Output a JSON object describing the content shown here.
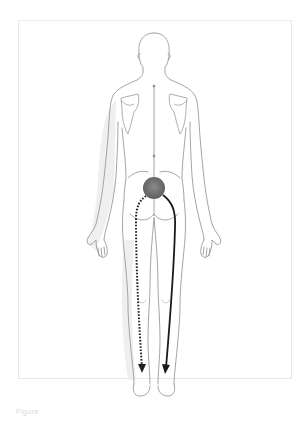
{
  "figure": {
    "pain_focus": {
      "label": "sacroiliac pain source",
      "color": "#6e6e6e"
    },
    "paths": [
      {
        "name": "dotted-referral-path",
        "style": "dotted",
        "side": "left",
        "color": "#222222"
      },
      {
        "name": "solid-referral-path",
        "style": "solid",
        "side": "right",
        "color": "#1a1a1a"
      }
    ],
    "outline_color": "#9a9a9a"
  },
  "caption": {
    "text": "Figure"
  }
}
